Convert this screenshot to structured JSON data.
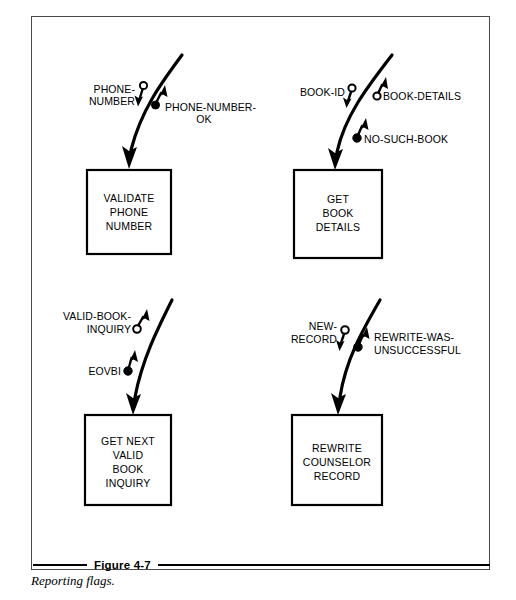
{
  "figure": {
    "number": "Figure 4-7",
    "title": "Reporting flags.",
    "frame_color": "#4a4a4a",
    "ink_color": "#000000"
  },
  "diagram": {
    "type": "structure-chart-flags",
    "processes": [
      {
        "id": "validate-phone-number",
        "lines": [
          "VALIDATE",
          "PHONE",
          "NUMBER"
        ],
        "box": {
          "x": 87,
          "y": 170,
          "w": 84,
          "h": 84
        },
        "flags": [
          {
            "name": "PHONE-NUMBER",
            "label_lines": [
              "PHONE-",
              "NUMBER"
            ],
            "marker": "open-circle",
            "direction": "down",
            "role": "input-data"
          },
          {
            "name": "PHONE-NUMBER-OK",
            "label_lines": [
              "PHONE-NUMBER-",
              "OK"
            ],
            "marker": "filled-dot",
            "direction": "up",
            "role": "output-flag"
          }
        ]
      },
      {
        "id": "get-book-details",
        "lines": [
          "GET",
          "BOOK",
          "DETAILS"
        ],
        "box": {
          "x": 294,
          "y": 170,
          "w": 88,
          "h": 88
        },
        "flags": [
          {
            "name": "BOOK-ID",
            "label_lines": [
              "BOOK-ID"
            ],
            "marker": "open-circle",
            "direction": "down",
            "role": "input-data"
          },
          {
            "name": "BOOK-DETAILS",
            "label_lines": [
              "BOOK-DETAILS"
            ],
            "marker": "open-circle",
            "direction": "up",
            "role": "output-data"
          },
          {
            "name": "NO-SUCH-BOOK",
            "label_lines": [
              "NO-SUCH-BOOK"
            ],
            "marker": "filled-dot",
            "direction": "up",
            "role": "output-flag"
          }
        ]
      },
      {
        "id": "get-next-valid-book-inquiry",
        "lines": [
          "GET NEXT",
          "VALID",
          "BOOK",
          "INQUIRY"
        ],
        "box": {
          "x": 85,
          "y": 415,
          "w": 86,
          "h": 90
        },
        "flags": [
          {
            "name": "VALID-BOOK-INQUIRY",
            "label_lines": [
              "VALID-BOOK-",
              "INQUIRY"
            ],
            "marker": "open-circle",
            "direction": "up",
            "role": "output-data"
          },
          {
            "name": "EOVBI",
            "label_lines": [
              "EOVBI"
            ],
            "marker": "filled-dot",
            "direction": "up",
            "role": "output-flag"
          }
        ]
      },
      {
        "id": "rewrite-counselor-record",
        "lines": [
          "REWRITE",
          "COUNSELOR",
          "RECORD"
        ],
        "box": {
          "x": 292,
          "y": 415,
          "w": 90,
          "h": 90
        },
        "flags": [
          {
            "name": "NEW-RECORD",
            "label_lines": [
              "NEW-",
              "RECORD"
            ],
            "marker": "open-circle",
            "direction": "down",
            "role": "input-data"
          },
          {
            "name": "REWRITE-WAS-UNSUCCESSFUL",
            "label_lines": [
              "REWRITE-WAS-",
              "UNSUCCESSFUL"
            ],
            "marker": "filled-dot",
            "direction": "up",
            "role": "output-flag"
          }
        ]
      }
    ]
  }
}
